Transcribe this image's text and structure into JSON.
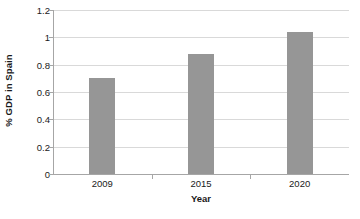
{
  "chart_data": {
    "type": "bar",
    "title": "",
    "categories": [
      "2009",
      "2015",
      "2020"
    ],
    "values": [
      0.7,
      0.88,
      1.04
    ],
    "series": [
      {
        "name": "% GDP in Spain",
        "values": [
          0.7,
          0.88,
          1.04
        ]
      }
    ],
    "xlabel": "Year",
    "ylabel": "% GDP in Spain",
    "ylim": [
      0,
      1.2
    ],
    "yticks": [
      0,
      0.2,
      0.4,
      0.6,
      0.8,
      1,
      1.2
    ],
    "ytick_labels": [
      "0",
      "0.2",
      "0.4",
      "0.6",
      "0.8",
      "1",
      "1.2"
    ],
    "grid": "horizontal",
    "legend": "none",
    "bar_color": "#969696",
    "gridline_color": "#d9d9d9",
    "axis_color": "#a6a6a6",
    "background_color": "#ffffff"
  }
}
